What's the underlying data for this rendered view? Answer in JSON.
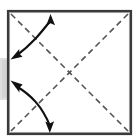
{
  "figure": {
    "canvas": {
      "width": 137,
      "height": 140,
      "background": "#ffffff"
    }
  },
  "colors": {
    "paper_fill": "#ffffff",
    "frame_stroke": "#3a3a3a",
    "frame_highlight": "#8e8e8e",
    "shadow": "#d9d9d9",
    "crease_stroke": "#555555",
    "arrow_stroke": "#111111"
  },
  "paper": {
    "name": "square-sheet",
    "x": 8,
    "y": 11,
    "width": 123,
    "height": 123,
    "stroke_width": 2.2
  },
  "shadow": {
    "name": "drop-shadow",
    "x": 0,
    "y": 58,
    "width": 8,
    "height": 42
  },
  "creases": [
    {
      "name": "crease-diagonal-tl-br",
      "type": "valley-fold-dashed",
      "from": {
        "x": 11,
        "y": 14
      },
      "to": {
        "x": 128,
        "y": 131
      },
      "dash": "6 4",
      "stroke_width": 1.6
    },
    {
      "name": "crease-diagonal-tr-bl",
      "type": "valley-fold-dashed",
      "from": {
        "x": 128,
        "y": 14
      },
      "to": {
        "x": 11,
        "y": 131
      },
      "dash": "6 4",
      "stroke_width": 1.6
    }
  ],
  "crease_intersection": {
    "x": 70,
    "y": 72
  },
  "arrows": [
    {
      "name": "fold-arrow-upper",
      "style": "double-headed-curved",
      "label": "fold and unfold corner",
      "path": "M 51 20 C 40 34 32 44 16 56",
      "stroke_width": 2.2,
      "head_start": {
        "x": 51,
        "y": 17,
        "angle": -72
      },
      "head_end": {
        "x": 13,
        "y": 58,
        "angle": 214
      }
    },
    {
      "name": "fold-arrow-lower",
      "style": "double-headed-curved",
      "label": "fold and unfold corner",
      "path": "M 16 86 C 31 95 42 106 50 126",
      "stroke_width": 2.2,
      "head_start": {
        "x": 13,
        "y": 84,
        "angle": 208
      },
      "head_end": {
        "x": 50,
        "y": 130,
        "angle": 76
      }
    }
  ]
}
